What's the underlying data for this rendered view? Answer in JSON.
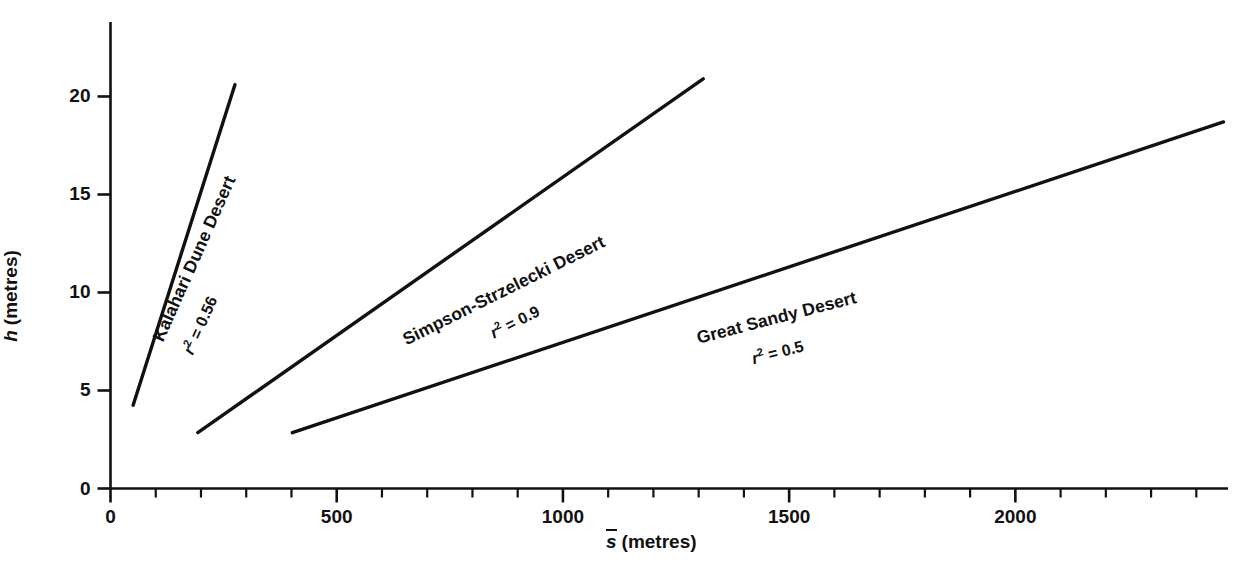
{
  "chart_data": {
    "type": "line",
    "title": "",
    "subtitle": "",
    "xlabel": "s (metres)",
    "ylabel": "h (metres)",
    "xlabel_symbol": "s",
    "ylabel_symbol": "h",
    "xlabel_unit": "(metres)",
    "ylabel_unit": "(metres)",
    "xlim": [
      0,
      2470
    ],
    "ylim": [
      0,
      23.8
    ],
    "x_major_ticks": [
      0,
      500,
      1000,
      1500,
      2000
    ],
    "x_major_tick_labels": [
      "0",
      "500",
      "1000",
      "1500",
      "2000"
    ],
    "x_minor_tick_step": 100,
    "y_major_ticks": [
      0,
      5,
      10,
      15,
      20
    ],
    "y_major_tick_labels": [
      "0",
      "5",
      "10",
      "15",
      "20"
    ],
    "grid": false,
    "legend": "inline-rotated-labels",
    "series": [
      {
        "name": "Kalahari Dune Desert",
        "r_squared": "0.56",
        "r_squared_text": "r 2 = 0.56",
        "x": [
          50,
          275
        ],
        "y": [
          4.25,
          20.6
        ],
        "label_angle_deg": -66,
        "color": "#111111"
      },
      {
        "name": "Simpson-Strzelecki Desert",
        "r_squared": "0.9",
        "r_squared_text": "r 2 = 0.9",
        "x": [
          193,
          1310
        ],
        "y": [
          2.85,
          20.9
        ],
        "label_angle_deg": -26,
        "color": "#111111"
      },
      {
        "name": "Great Sandy Desert",
        "r_squared": "0.5",
        "r_squared_text": "r 2 = 0.5",
        "x": [
          402,
          2460
        ],
        "y": [
          2.85,
          18.7
        ],
        "label_angle_deg": -14,
        "color": "#111111"
      }
    ],
    "colors": {
      "line": "#111111",
      "axis": "#111111",
      "background": "#ffffff",
      "text": "#111111"
    }
  },
  "axis_labels": {
    "x": {
      "symbol": "s",
      "unit": "(metres)"
    },
    "y": {
      "symbol": "h",
      "unit": "(metres)"
    }
  },
  "xticks": [
    {
      "value": 0,
      "label": "0"
    },
    {
      "value": 500,
      "label": "500"
    },
    {
      "value": 1000,
      "label": "1000"
    },
    {
      "value": 1500,
      "label": "1500"
    },
    {
      "value": 2000,
      "label": "2000"
    }
  ],
  "yticks": [
    {
      "value": 0,
      "label": "0"
    },
    {
      "value": 5,
      "label": "5"
    },
    {
      "value": 10,
      "label": "10"
    },
    {
      "value": 15,
      "label": "15"
    },
    {
      "value": 20,
      "label": "20"
    }
  ],
  "series_labels": [
    {
      "name": "Kalahari Dune Desert",
      "r_prefix": "r",
      "r_exp": "2",
      "r_rest": " = 0.56"
    },
    {
      "name": "Simpson-Strzelecki Desert",
      "r_prefix": "r",
      "r_exp": "2",
      "r_rest": " = 0.9"
    },
    {
      "name": "Great Sandy Desert",
      "r_prefix": "r",
      "r_exp": "2",
      "r_rest": " = 0.5"
    }
  ]
}
